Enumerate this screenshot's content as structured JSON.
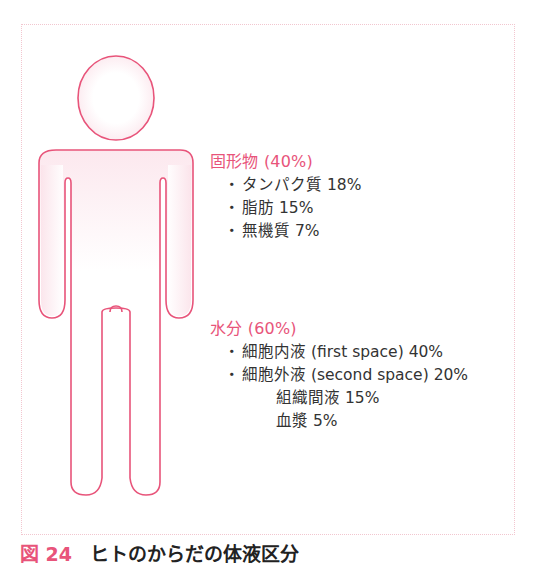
{
  "figure": {
    "colors": {
      "outline": "#e8547a",
      "fill_shade": "#fbe3ea",
      "accent_text": "#e8547a",
      "body_text": "#333333",
      "frame_border": "#f2c6cf"
    },
    "solids": {
      "title": "固形物 (40%)",
      "items": [
        {
          "bullet": "・",
          "label": "タンパク質 18%"
        },
        {
          "bullet": "・",
          "label": "脂肪 15%"
        },
        {
          "bullet": "・",
          "label": "無機質 7%"
        }
      ]
    },
    "water": {
      "title": "水分 (60%)",
      "items": [
        {
          "bullet": "・",
          "label": "細胞内液 (first space) 40%"
        },
        {
          "bullet": "・",
          "label": "細胞外液 (second space) 20%"
        }
      ],
      "sub_items": [
        {
          "label": "組織間液 15%"
        },
        {
          "label": "血漿 5%"
        }
      ]
    },
    "caption": {
      "number": "図 24",
      "title": "ヒトのからだの体液区分"
    }
  }
}
